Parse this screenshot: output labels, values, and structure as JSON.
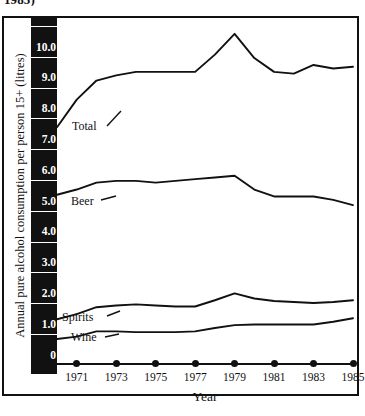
{
  "title_clipped": "1985)",
  "axes": {
    "ylabel": "Annual pure alcohol consumption per person 15+ (litres)",
    "xlabel": "Year",
    "yticks": [
      "10.0",
      "9.0",
      "8.0",
      "7.0",
      "6.0",
      "5.0",
      "4.0",
      "3.0",
      "2.0",
      "1.0",
      "0"
    ],
    "xticks": [
      "1971",
      "1973",
      "1975",
      "1977",
      "1979",
      "1981",
      "1983",
      "1985"
    ]
  },
  "series_labels": {
    "total": "Total",
    "beer": "Beer",
    "spirits": "Spirits",
    "wine": "Wine"
  },
  "colors": {
    "line": "#111111",
    "axis_band": "#111111",
    "tick_text": "#ffffff",
    "frame": "#111111",
    "background": "#ffffff"
  },
  "chart_data": {
    "type": "line",
    "title": "1985)",
    "xlabel": "Year",
    "ylabel": "Annual pure alcohol consumption per person 15+ (litres)",
    "x": [
      1970,
      1971,
      1972,
      1973,
      1974,
      1975,
      1976,
      1977,
      1978,
      1979,
      1980,
      1981,
      1982,
      1983,
      1984,
      1985
    ],
    "xlim": [
      1970,
      1985
    ],
    "ylim": [
      0,
      10
    ],
    "xticks": [
      1971,
      1973,
      1975,
      1977,
      1979,
      1981,
      1983,
      1985
    ],
    "yticks": [
      0,
      1,
      2,
      3,
      4,
      5,
      6,
      7,
      8,
      9,
      10
    ],
    "grid": false,
    "legend": "inline-labels",
    "series": [
      {
        "name": "Total",
        "values": [
          6.9,
          7.7,
          8.25,
          8.4,
          8.5,
          8.5,
          8.5,
          8.5,
          9.0,
          9.6,
          8.9,
          8.5,
          8.45,
          8.7,
          8.6,
          8.65
        ]
      },
      {
        "name": "Beer",
        "values": [
          4.95,
          5.1,
          5.3,
          5.35,
          5.35,
          5.3,
          5.35,
          5.4,
          5.45,
          5.5,
          5.1,
          4.9,
          4.9,
          4.9,
          4.8,
          4.65
        ]
      },
      {
        "name": "Spirits",
        "values": [
          1.35,
          1.5,
          1.7,
          1.75,
          1.78,
          1.75,
          1.72,
          1.72,
          1.9,
          2.1,
          1.95,
          1.88,
          1.85,
          1.82,
          1.85,
          1.9
        ]
      },
      {
        "name": "Wine",
        "values": [
          0.78,
          0.85,
          1.0,
          1.0,
          0.98,
          0.98,
          0.98,
          1.0,
          1.1,
          1.18,
          1.2,
          1.2,
          1.2,
          1.2,
          1.28,
          1.38
        ]
      }
    ]
  }
}
